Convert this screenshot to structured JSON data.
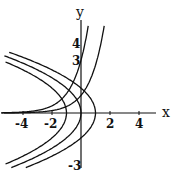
{
  "chart_data": {
    "type": "line",
    "title": "",
    "xlabel": "x",
    "ylabel": "y",
    "xlim": [
      -5.5,
      5.2
    ],
    "ylim": [
      -3.1,
      5.0
    ],
    "grid": false,
    "x_ticks": [
      -4,
      -2,
      2,
      4
    ],
    "y_ticks": [
      4,
      3,
      -3
    ],
    "x_tick_labels": [
      "-4",
      "-2",
      "2",
      "4"
    ],
    "y_tick_labels": [
      "4",
      "3",
      "-3"
    ],
    "series": [
      {
        "name": "y = 3e^x",
        "kind": "exponential",
        "a": 3,
        "x_range": [
          -5.5,
          0.5
        ]
      },
      {
        "name": "y = e^x",
        "kind": "exponential",
        "a": 1,
        "x_range": [
          -5.5,
          1.6
        ]
      },
      {
        "name": "x = 1 - y^2/2",
        "kind": "parabola",
        "c": 1,
        "k": 2
      },
      {
        "name": "x = -y^2/2",
        "kind": "parabola",
        "c": 0,
        "k": 2
      },
      {
        "name": "x = -1 - y^2/2",
        "kind": "parabola",
        "c": -1,
        "k": 2
      }
    ],
    "line_color": "#111111"
  },
  "labels": {
    "x_axis": "x",
    "y_axis": "y",
    "tick_x_m4": "-4",
    "tick_x_m2": "-2",
    "tick_x_2": "2",
    "tick_x_4": "4",
    "tick_y_4": "4",
    "tick_y_3": "3",
    "tick_y_m3": "-3"
  }
}
